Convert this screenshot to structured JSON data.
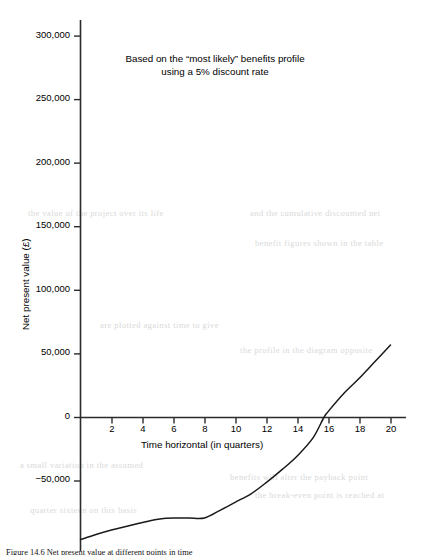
{
  "figure": {
    "title_line1": "Based on the “most likely” benefits profile",
    "title_line2": "using a 5% discount rate",
    "caption": "Figure 14.6  Net present value at different points in time",
    "axis_color": "#2b2b2b",
    "curve_color": "#1a1a1a"
  },
  "chart_data": {
    "type": "line",
    "title": "Based on the “most likely” benefits profile using a 5% discount rate",
    "xlabel": "Time horizontal (in quarters)",
    "ylabel": "Net present value (£)",
    "xlim": [
      0,
      21
    ],
    "ylim": [
      -100000,
      312000
    ],
    "grid": false,
    "legend": null,
    "xticks": [
      2,
      4,
      6,
      8,
      10,
      12,
      14,
      16,
      18,
      20
    ],
    "xticklabels": [
      "2",
      "4",
      "6",
      "8",
      "10",
      "12",
      "14",
      "16",
      "18",
      "20"
    ],
    "yticks": [
      0,
      50000,
      100000,
      150000,
      200000,
      250000,
      300000
    ],
    "yticklabels": [
      "0",
      "50,000",
      "100,000",
      "150,000",
      "200,000",
      "250,000",
      "300,000"
    ],
    "negative_yticks": [
      -50000
    ],
    "negative_yticklabels": [
      "−50,000"
    ],
    "series": [
      {
        "name": "Net present value",
        "x": [
          0,
          1,
          2,
          3,
          4,
          5,
          5.6,
          6,
          7,
          8,
          9,
          10,
          11,
          12,
          13,
          14,
          15,
          15.7,
          16,
          17,
          18,
          19,
          20
        ],
        "y": [
          -96000,
          -92000,
          -88500,
          -85500,
          -82500,
          -80000,
          -79200,
          -79000,
          -79000,
          -79000,
          -73000,
          -66500,
          -60000,
          -51000,
          -41000,
          -30000,
          -16000,
          0,
          5000,
          19000,
          31000,
          44000,
          57000
        ]
      }
    ],
    "zero_crossing_x": 15.7,
    "min_value": -96000,
    "max_value": 57000,
    "plateau_range_x": [
      5.6,
      8
    ],
    "plateau_value": -79000
  },
  "ghost_text": {
    "lines": [
      "the value of the project over its life",
      "and the cumulative discounted net",
      "benefit figures shown in the table",
      "are plotted against time to give",
      "the profile in the diagram opposite",
      "a small variation in the assumed",
      "benefits will alter the payback point",
      "the break-even point is reached at",
      "quarter sixteen on this basis"
    ]
  }
}
